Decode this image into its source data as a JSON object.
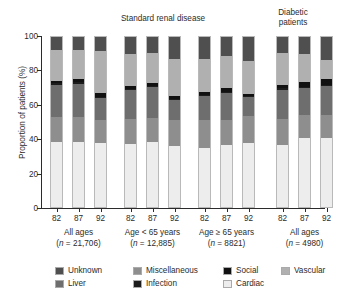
{
  "panels": {
    "standard": "Standard renal disease",
    "diabetic": "Diabetic\npatients"
  },
  "axes": {
    "ylabel": "Proportion of patients (%)",
    "yticks": [
      "0",
      "20",
      "40",
      "60",
      "80",
      "100"
    ],
    "ylim": [
      0,
      100
    ]
  },
  "groups": [
    {
      "name": "All ages",
      "n": "(n = 21,706)",
      "ticks": [
        "82",
        "87",
        "92"
      ]
    },
    {
      "name": "Age < 65 years",
      "n": "(n = 12,885)",
      "ticks": [
        "82",
        "87",
        "92"
      ]
    },
    {
      "name": "Age ≥ 65 years",
      "n": "(n = 8821)",
      "ticks": [
        "82",
        "87",
        "92"
      ]
    },
    {
      "name": "All ages",
      "n": "(n = 4980)",
      "ticks": [
        "82",
        "87",
        "92"
      ]
    }
  ],
  "legend": {
    "row1": [
      {
        "label": "Unknown",
        "color": "#4f4f4f",
        "key": "unknown"
      },
      {
        "label": "Miscellaneous",
        "color": "#8e8e8e",
        "key": "miscellaneous"
      },
      {
        "label": "Social",
        "color": "#111111",
        "key": "social"
      },
      {
        "label": "Vascular",
        "color": "#b0b0b0",
        "key": "vascular"
      }
    ],
    "row2": [
      {
        "label": "Liver",
        "color": "#6e6e6e",
        "key": "liver"
      },
      {
        "label": "Infection",
        "color": "#1c1c1c",
        "key": "infection"
      },
      {
        "label": "Cardiac",
        "color": "#ededed",
        "key": "cardiac"
      }
    ]
  },
  "colors": {
    "unknown": "#4f4f4f",
    "vascular": "#b0b0b0",
    "social": "#111111",
    "liver": "#6e6e6e",
    "infection": "#1c1c1c",
    "miscellaneous": "#8e8e8e",
    "cardiac": "#ededed",
    "axis": "#2b2b2b",
    "background": "#ffffff"
  },
  "chart_data": {
    "type": "bar",
    "subtype": "stacked-percentage",
    "title": "",
    "xlabel": "",
    "ylabel": "Proportion of patients (%)",
    "ylim": [
      0,
      100
    ],
    "grid": false,
    "legend_position": "bottom",
    "stack_order_bottom_to_top": [
      "cardiac",
      "miscellaneous",
      "liver",
      "infection",
      "social",
      "vascular",
      "unknown"
    ],
    "categories": [
      "All ages 82",
      "All ages 87",
      "All ages 92",
      "Age<65 82",
      "Age<65 87",
      "Age<65 92",
      "Age>=65 82",
      "Age>=65 87",
      "Age>=65 92",
      "Diabetic 82",
      "Diabetic 87",
      "Diabetic 92"
    ],
    "series": [
      {
        "name": "Cardiac",
        "values": [
          38,
          38.5,
          37.5,
          37,
          38.5,
          36,
          34.5,
          36.5,
          37.5,
          36.5,
          40.5,
          40.5
        ]
      },
      {
        "name": "Miscellaneous",
        "values": [
          15,
          14.5,
          13.5,
          15,
          14,
          15,
          16.5,
          14.5,
          16,
          15.5,
          13.5,
          13.5
        ]
      },
      {
        "name": "Liver",
        "values": [
          19,
          19.5,
          13,
          17,
          18,
          12,
          14.5,
          16,
          11,
          17,
          16,
          17
        ]
      },
      {
        "name": "Infection",
        "values": [
          0.8,
          0.8,
          0.8,
          0.7,
          0.7,
          0.7,
          0.6,
          0.6,
          0.6,
          0.8,
          0.8,
          0.8
        ]
      },
      {
        "name": "Social",
        "values": [
          1.2,
          2.2,
          2.2,
          1.3,
          1.8,
          1.8,
          1.4,
          2.4,
          1.4,
          2.2,
          2.7,
          3.2
        ]
      },
      {
        "name": "Vascular",
        "values": [
          18.5,
          17,
          24.5,
          19,
          17.5,
          21.5,
          19.5,
          19,
          19.5,
          18.5,
          16.5,
          11.5
        ]
      },
      {
        "name": "Unknown",
        "values": [
          7.5,
          7.5,
          8.5,
          10,
          9.5,
          13,
          13,
          11,
          14,
          9.5,
          10,
          13.5
        ]
      }
    ]
  }
}
